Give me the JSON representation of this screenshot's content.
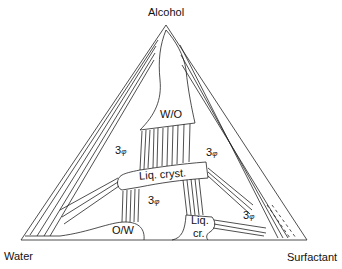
{
  "diagram": {
    "type": "ternary-phase-diagram",
    "vertices": {
      "top": "Alcohol",
      "bottom_left": "Water",
      "bottom_right": "Surfactant"
    },
    "regions": {
      "wo": "W/O",
      "ow": "O/W",
      "liq_cryst": "Liq. cryst.",
      "liq_cr_line1": "Liq.",
      "liq_cr_line2": "cr.",
      "three_phase_left": "3",
      "three_phase_right": "3",
      "three_phase_center": "3",
      "three_phase_lower_right": "3",
      "phi": "φ"
    },
    "line_color": "#222222",
    "background": "#ffffff"
  }
}
